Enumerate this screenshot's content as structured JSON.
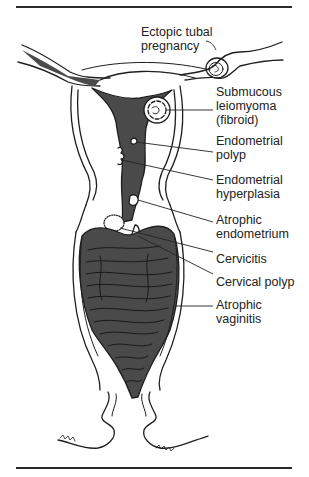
{
  "figure": {
    "type": "anatomical-diagram",
    "colors": {
      "line": "#1e1e1e",
      "fill_dark": "#4a4a4a",
      "background": "#ffffff"
    }
  },
  "labels": [
    {
      "id": "ectopic",
      "lines": [
        "Ectopic tubal",
        "pregnancy"
      ]
    },
    {
      "id": "leiomyoma",
      "lines": [
        "Submucous",
        "leiomyoma",
        "(fibroid)"
      ]
    },
    {
      "id": "polyp",
      "lines": [
        "Endometrial",
        "polyp"
      ]
    },
    {
      "id": "hyperplasia",
      "lines": [
        "Endometrial",
        "hyperplasia"
      ]
    },
    {
      "id": "atrophic-endo",
      "lines": [
        "Atrophic",
        "endometrium"
      ]
    },
    {
      "id": "cervicitis",
      "lines": [
        "Cervicitis"
      ]
    },
    {
      "id": "cervical-polyp",
      "lines": [
        "Cervical polyp"
      ]
    },
    {
      "id": "vaginitis",
      "lines": [
        "Atrophic",
        "vaginitis"
      ]
    }
  ]
}
